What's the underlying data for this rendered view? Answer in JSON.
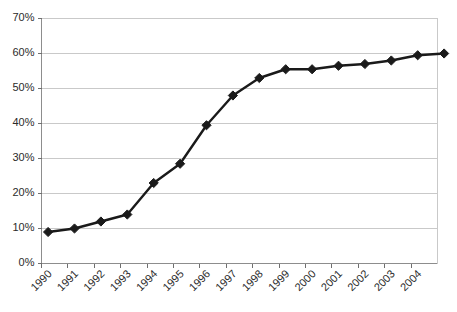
{
  "chart_data": {
    "type": "line",
    "title": "",
    "subtitle": "",
    "xlabel": "",
    "ylabel": "",
    "grid": true,
    "legend": false,
    "legend_position": "none",
    "ylim": [
      0,
      70
    ],
    "y_tick_labels": [
      "0%",
      "10%",
      "20%",
      "30%",
      "40%",
      "50%",
      "60%",
      "70%"
    ],
    "y_tick_values": [
      0,
      10,
      20,
      30,
      40,
      50,
      60,
      70
    ],
    "x_tick_labels": [
      "1990",
      "1991",
      "1992",
      "1993",
      "1994",
      "1995",
      "1996",
      "1997",
      "1998",
      "1999",
      "2000",
      "2001",
      "2002",
      "2003",
      "2004"
    ],
    "categories": [
      "1990",
      "1991",
      "1992",
      "1993",
      "1994",
      "1995",
      "1996",
      "1997",
      "1998",
      "1999",
      "2000",
      "2001",
      "2002",
      "2003",
      "2004",
      "2005"
    ],
    "values": [
      9,
      10,
      12,
      14,
      23,
      28.5,
      39.5,
      48,
      53,
      55.5,
      55.5,
      56.5,
      57,
      58,
      59.5,
      60
    ],
    "marker": "diamond",
    "series_color": "#1a1a1a",
    "grid_color": "#c9c9c9",
    "axis_color": "#8d8d8d",
    "background_color": "#ffffff"
  },
  "axis": {
    "y_label_unit": "%",
    "x_label_rotation": "-45"
  }
}
